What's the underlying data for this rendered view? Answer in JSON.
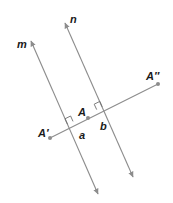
{
  "diagram": {
    "colors": {
      "line": "#8c8c8c",
      "point": "#8c8c8c",
      "label": "#1a1a1a"
    },
    "lines": [
      {
        "id": "m",
        "label": "m",
        "from": [
          30,
          40
        ],
        "to": [
          98,
          195
        ],
        "arrows": "both"
      },
      {
        "id": "n",
        "label": "n",
        "from": [
          64,
          22
        ],
        "to": [
          133,
          178
        ],
        "arrows": "both"
      }
    ],
    "segment": {
      "from": "A'",
      "to": "A''",
      "perpendicular_to": [
        "m",
        "n"
      ]
    },
    "points": [
      {
        "id": "A_prime",
        "label": "A′",
        "x": 50,
        "y": 138
      },
      {
        "id": "A",
        "label": "A",
        "x": 88,
        "y": 118
      },
      {
        "id": "A_double_prime",
        "label": "A″",
        "x": 158,
        "y": 84
      }
    ],
    "intersections": [
      {
        "id": "a",
        "label": "a",
        "on_line": "m",
        "right_angle": true
      },
      {
        "id": "b",
        "label": "b",
        "on_line": "n",
        "right_angle": true
      }
    ],
    "labels": {
      "m": "m",
      "n": "n",
      "A_prime": "A′",
      "A": "A",
      "A_double_prime": "A″",
      "a": "a",
      "b": "b"
    }
  }
}
